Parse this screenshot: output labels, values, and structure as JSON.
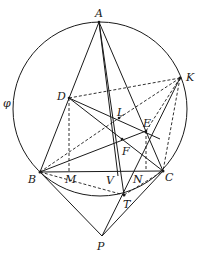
{
  "diagram": {
    "type": "geometry",
    "circle": {
      "name": "φ",
      "cx": 100,
      "cy": 109,
      "r": 87
    },
    "points": {
      "A": [
        99,
        22
      ],
      "K": [
        180,
        78
      ],
      "D": [
        69,
        98
      ],
      "L": [
        119,
        118
      ],
      "E": [
        146,
        131
      ],
      "F": [
        122,
        139
      ],
      "B": [
        40,
        172
      ],
      "M": [
        69,
        172
      ],
      "V": [
        117,
        172
      ],
      "N": [
        147,
        171
      ],
      "C": [
        163,
        171
      ],
      "T": [
        124,
        195
      ],
      "P": [
        102,
        236
      ]
    },
    "labels": {
      "phi": "φ",
      "A": "A",
      "K": "K",
      "D": "D",
      "L": "L",
      "E": "E",
      "F": "F",
      "B": "B",
      "M": "M",
      "V": "V",
      "N": "N",
      "C": "C",
      "T": "T",
      "P": "P"
    },
    "solid_segments": [
      [
        "A",
        "B"
      ],
      [
        "A",
        "C"
      ],
      [
        "A",
        "V"
      ],
      [
        "A",
        "T"
      ],
      [
        "B",
        "C"
      ],
      [
        "B",
        "E"
      ],
      [
        "D",
        "C"
      ],
      [
        "D",
        "E"
      ],
      [
        "B",
        "P"
      ],
      [
        "P",
        "C"
      ],
      [
        "P",
        "K"
      ],
      [
        "B",
        "D"
      ]
    ],
    "dashed_segments": [
      [
        "D",
        "K"
      ],
      [
        "D",
        "M"
      ],
      [
        "K",
        "L"
      ],
      [
        "K",
        "E"
      ],
      [
        "K",
        "C"
      ],
      [
        "B",
        "L"
      ],
      [
        "B",
        "T"
      ],
      [
        "T",
        "C"
      ],
      [
        "E",
        "N"
      ]
    ]
  }
}
